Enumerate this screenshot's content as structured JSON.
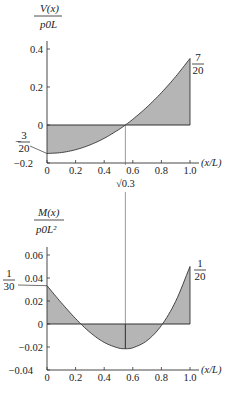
{
  "chart_data": [
    {
      "type": "area",
      "title": "",
      "ylabel_num": "V(x)",
      "ylabel_den": "p0L",
      "xlabel": "(x/L)",
      "x_ticks": [
        "0",
        "0.2",
        "0.4",
        "0.6",
        "0.8",
        "1.0"
      ],
      "y_ticks": [
        "0.4",
        "0.2",
        "0",
        "-0.2"
      ],
      "y_tick_values": [
        0.4,
        0.2,
        0,
        -0.2
      ],
      "xlim": [
        0,
        1
      ],
      "ylim": [
        -0.2,
        0.4
      ],
      "formula": "V/(p0 L) = (xi^2 - 0.3)/2",
      "x": [
        0,
        0.1,
        0.2,
        0.3,
        0.4,
        0.5,
        0.548,
        0.6,
        0.7,
        0.8,
        0.9,
        1.0
      ],
      "values": [
        -0.15,
        -0.145,
        -0.13,
        -0.105,
        -0.07,
        -0.025,
        0,
        0.03,
        0.095,
        0.17,
        0.255,
        0.35
      ],
      "annotations": [
        {
          "text_num": "3",
          "text_den": "20",
          "sign": "−",
          "at_x": 0,
          "value": -0.15
        },
        {
          "text_num": "7",
          "text_den": "20",
          "sign": "",
          "at_x": 1.0,
          "value": 0.35
        },
        {
          "text": "√0.3",
          "at_x": 0.548,
          "value": 0
        }
      ],
      "grid": false
    },
    {
      "type": "area",
      "title": "",
      "ylabel_num": "M(x)",
      "ylabel_den": "p0L²",
      "xlabel": "(x/L)",
      "x_ticks": [
        "0",
        "0.2",
        "0.4",
        "0.6",
        "0.8",
        "1.0"
      ],
      "y_ticks": [
        "0.06",
        "0.04",
        "0.02",
        "0",
        "-0.02",
        "-0.04"
      ],
      "y_tick_values": [
        0.06,
        0.04,
        0.02,
        0,
        -0.02,
        -0.04
      ],
      "xlim": [
        0,
        1
      ],
      "ylim": [
        -0.04,
        0.06
      ],
      "formula": "M/(p0 L^2) = xi^3/6 - 0.15 xi + 1/30",
      "x": [
        0,
        0.1,
        0.2,
        0.3,
        0.4,
        0.5,
        0.548,
        0.6,
        0.7,
        0.8,
        0.9,
        1.0
      ],
      "values": [
        0.0333,
        0.0185,
        0.0047,
        -0.0072,
        -0.016,
        -0.0209,
        -0.0215,
        -0.0207,
        -0.0144,
        -0.0013,
        0.0198,
        0.05
      ],
      "annotations": [
        {
          "text_num": "1",
          "text_den": "30",
          "sign": "",
          "at_x": 0,
          "value": 0.0333
        },
        {
          "text_num": "1",
          "text_den": "20",
          "sign": "",
          "at_x": 1.0,
          "value": 0.05
        }
      ],
      "grid": false
    }
  ]
}
